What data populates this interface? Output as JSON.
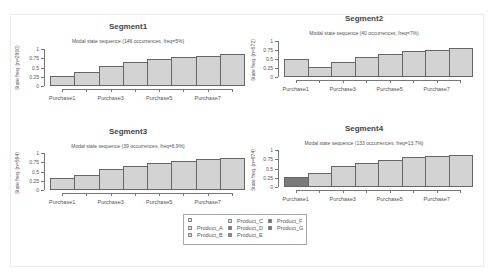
{
  "chart_data": [
    {
      "type": "bar",
      "title": "Segment1",
      "subtitle": "Modal state sequence (146 occurrences, freq=5%)",
      "ylabel": "State freq. (n=2900)",
      "categories": [
        "Purchase1",
        "Purchase2",
        "Purchase3",
        "Purchase4",
        "Purchase5",
        "Purchase6",
        "Purchase7",
        "Purchase8"
      ],
      "x_tick_labels": [
        "Purchase1",
        "Purchase3",
        "Purchase5",
        "Purchase7"
      ],
      "values": [
        0.27,
        0.38,
        0.55,
        0.65,
        0.73,
        0.78,
        0.82,
        0.87
      ],
      "bar_states": [
        "light",
        "light",
        "light",
        "light",
        "light",
        "light",
        "light",
        "light"
      ],
      "yticks": [
        "0",
        "0.25",
        "0.5",
        "0.75",
        "1"
      ],
      "ylim": [
        0,
        1
      ]
    },
    {
      "type": "bar",
      "title": "Segment2",
      "subtitle": "Modal state sequence (40 occurrences, freq=7%)",
      "ylabel": "State freq. (n=572)",
      "categories": [
        "Purchase1",
        "Purchase2",
        "Purchase3",
        "Purchase4",
        "Purchase5",
        "Purchase6",
        "Purchase7",
        "Purchase8"
      ],
      "x_tick_labels": [
        "Purchase1",
        "Purchase3",
        "Purchase5",
        "Purchase7"
      ],
      "values": [
        0.5,
        0.27,
        0.43,
        0.55,
        0.63,
        0.72,
        0.76,
        0.8
      ],
      "bar_states": [
        "light",
        "light",
        "light",
        "light",
        "light",
        "light",
        "light",
        "light"
      ],
      "yticks": [
        "0",
        "0.25",
        "0.5",
        "0.75",
        "1"
      ],
      "ylim": [
        0,
        1
      ]
    },
    {
      "type": "bar",
      "title": "Segment3",
      "subtitle": "Modal state sequence (39 occurrences, freq=6.9%)",
      "ylabel": "State freq. (n=564)",
      "categories": [
        "Purchase1",
        "Purchase2",
        "Purchase3",
        "Purchase4",
        "Purchase5",
        "Purchase6",
        "Purchase7",
        "Purchase8"
      ],
      "x_tick_labels": [
        "Purchase1",
        "Purchase3",
        "Purchase5",
        "Purchase7"
      ],
      "values": [
        0.32,
        0.4,
        0.57,
        0.65,
        0.72,
        0.79,
        0.85,
        0.87
      ],
      "bar_states": [
        "light",
        "light",
        "light",
        "light",
        "light",
        "light",
        "light",
        "light"
      ],
      "yticks": [
        "0",
        "0.25",
        "0.5",
        "0.75",
        "1"
      ],
      "ylim": [
        0,
        1
      ]
    },
    {
      "type": "bar",
      "title": "Segment4",
      "subtitle": "Modal state sequence (133 occurrences, freq=13.7%)",
      "ylabel": "State freq. (n=974)",
      "categories": [
        "Purchase1",
        "Purchase2",
        "Purchase3",
        "Purchase4",
        "Purchase5",
        "Purchase6",
        "Purchase7",
        "Purchase8"
      ],
      "x_tick_labels": [
        "Purchase1",
        "Purchase3",
        "Purchase5",
        "Purchase7"
      ],
      "values": [
        0.26,
        0.38,
        0.57,
        0.66,
        0.74,
        0.8,
        0.83,
        0.87
      ],
      "bar_states": [
        "dark",
        "light",
        "light",
        "light",
        "light",
        "light",
        "light",
        "light"
      ],
      "yticks": [
        "0",
        "0.25",
        "0.5",
        "0.75",
        "1"
      ],
      "ylim": [
        0,
        1
      ]
    }
  ],
  "legend": {
    "items": [
      {
        "label": "",
        "color": "#e8e8e8"
      },
      {
        "label": "Product_A",
        "color": "#e0e0e0"
      },
      {
        "label": "Product_B",
        "color": "#d3d3d3"
      },
      {
        "label": "Product_C",
        "color": "#d8d8d8"
      },
      {
        "label": "Product_D",
        "color": "#7a7a7a"
      },
      {
        "label": "Product_E",
        "color": "#8a8a8a"
      },
      {
        "label": "Product_F",
        "color": "#6e6e6e"
      },
      {
        "label": "Product_G",
        "color": "#777777"
      }
    ]
  },
  "colors": {
    "bar_light": "#d3d3d3",
    "bar_dark": "#7a7a7a",
    "bar_border": "#666666"
  }
}
